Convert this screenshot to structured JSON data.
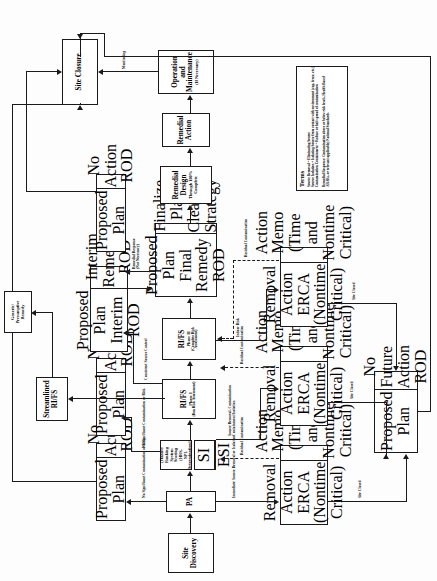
{
  "diagram": {
    "nodes": {
      "site_discovery": {
        "line1": "Site",
        "line2": "Discovery"
      },
      "pa": {
        "line1": "PA"
      },
      "hrs": {
        "line1": "(Hazard Ranking",
        "line2": "System Scoring (HRS,",
        "line3": "NPL Determination))"
      },
      "si": {
        "label": "SI"
      },
      "esi": {
        "label": "ESI"
      },
      "rifs_phase1": {
        "line1": "RI/FS",
        "line2": "Phase I",
        "line3": "(Don Risk Assessment)"
      },
      "rifs_phase2": {
        "line1": "RI/FS",
        "line2": "Phase II",
        "line3": "(Complete Risk Assessment)"
      },
      "streamlined_rifs": {
        "line1": "Streamlined",
        "line2": "RI/FS"
      },
      "generic_remedy": {
        "line1": "Generic/",
        "line2": "Presumptive",
        "line3": "Remedy"
      },
      "pp_no_action_1": {
        "left": "Proposed Plan",
        "right": "No Action ROD"
      },
      "pp_no_action_2": {
        "left": "Proposed Plan",
        "right": "No Action ROD"
      },
      "pp_no_action_3": {
        "left": "Proposed Plan",
        "right": "No Action ROD"
      },
      "pp_interim": {
        "left1": "Proposed Plan",
        "left2": "Interim ROD",
        "right1": "Interim",
        "right2": "Remedial ROD"
      },
      "pp_final": {
        "left1": "Proposed Plan",
        "left2": "Final Remedy",
        "left3": "ROD",
        "right1": "Finalize Plan",
        "right2": "Cleanup",
        "right3": "Strategy"
      },
      "remedial_design": {
        "line1": "Remedial Design",
        "line2": "Through 100%",
        "line3": "Complete"
      },
      "remedial_action": {
        "line1": "Remedial Action"
      },
      "om": {
        "line1": "Operation and",
        "line2": "Maintenance",
        "line3": "(If Necessary)"
      },
      "site_closure": {
        "line1": "Site Closure"
      },
      "removal_action_1": {
        "t1": "Removal Action",
        "t2": "ERCA",
        "t3": "(Nontime Critical)"
      },
      "action_memo_1": {
        "t1": "Action Memo",
        "t2": "(Time and",
        "t3": "Nontime Critical)"
      },
      "removal_action_2": {
        "t1": "Removal Action",
        "t2": "ERCA",
        "t3": "(Nontime Critical)"
      },
      "action_memo_2": {
        "t1": "Action Memo",
        "t2": "(Time and",
        "t3": "Nontime Critical)"
      },
      "removal_action_3": {
        "t1": "Removal Action",
        "t2": "ERCA",
        "t3": "(Nontime Critical)"
      },
      "action_memo_3": {
        "t1": "Action Memo",
        "t2": "(Time and",
        "t3": "Nontime Critical)"
      },
      "pp_no_future": {
        "left": "Proposed Plan",
        "right1": "No Future",
        "right2": "Action ROD"
      }
    },
    "edge_labels": {
      "no_sig_contam_1": "No Significant Contamination or Risk",
      "no_sig_contam_2": "No Significant Contamination or Risk",
      "consistent_source_control": "Consistent Source Control",
      "remedial_response": "Remedial Response\n(Not Necessary)",
      "immediate_source_removal": "Immediate Source Removal or Isolation",
      "residual_contamination_1": "Residual Contamination",
      "source_removal_containment": "Source Removal, Contamination\nContainment/Isolation",
      "residual_contamination_2": "Residual Contamination",
      "indoor_risk": "Indoor Risk",
      "residual_contamination_3": "Residual Contamination",
      "site_closed_1": "Site Closed",
      "site_closed_2": "Site Closed",
      "site_closed_3": "Site Closed",
      "monitoring": "Monitoring"
    },
    "terms": {
      "heading": "Terms",
      "lines": [
        "Source Removal = Eliminating Source",
        "Source Isolation = Isolating Source from contact with environment (cap, fence, etc.)",
        "Contamination Containment = Reduce or halt spread of contamination",
        "",
        "Remedial Response: Contamination above or below risk levels, Health Based",
        "ARARs, or relevant applicable) National Standards"
      ]
    }
  }
}
